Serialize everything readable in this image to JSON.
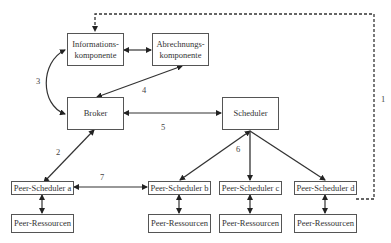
{
  "diagram": {
    "type": "architecture",
    "nodes": {
      "info": {
        "line1": "Informations-",
        "line2": "komponente"
      },
      "abrechnung": {
        "line1": "Abrechnungs-",
        "line2": "komponente"
      },
      "broker": {
        "label": "Broker"
      },
      "scheduler": {
        "label": "Scheduler"
      },
      "peer_scheduler_a": {
        "label": "Peer-Scheduler a"
      },
      "peer_scheduler_b": {
        "label": "Peer-Scheduler b"
      },
      "peer_scheduler_c": {
        "label": "Peer-Scheduler c"
      },
      "peer_scheduler_d": {
        "label": "Peer-Scheduler d"
      },
      "peer_ressourcen_a": {
        "label": "Peer-Ressourcen"
      },
      "peer_ressourcen_b": {
        "label": "Peer-Ressourcen"
      },
      "peer_ressourcen_c": {
        "label": "Peer-Ressourcen"
      },
      "peer_ressourcen_d": {
        "label": "Peer-Ressourcen"
      }
    },
    "edge_labels": {
      "e1": "1",
      "e2": "2",
      "e3": "3",
      "e4": "4",
      "e5": "5",
      "e6": "6",
      "e7": "7"
    },
    "edges": [
      {
        "id": "1",
        "from": "Peer-Scheduler d",
        "to": "Informationskomponente",
        "style": "dashed"
      },
      {
        "id": "2",
        "from": "Peer-Scheduler a",
        "to": "Broker",
        "style": "bidirectional"
      },
      {
        "id": "3",
        "from": "Informationskomponente",
        "to": "Broker",
        "style": "curved-bidirectional"
      },
      {
        "id": "4",
        "from": "Abrechnungskomponente",
        "to": "Broker",
        "style": "bidirectional"
      },
      {
        "id": "5",
        "from": "Broker",
        "to": "Scheduler",
        "style": "bidirectional"
      },
      {
        "id": "6",
        "from": "Scheduler",
        "to": "Peer-Scheduler b/c/d",
        "style": "arrows"
      },
      {
        "id": "7",
        "from": "Peer-Scheduler a",
        "to": "Peer-Scheduler b",
        "style": "bidirectional"
      }
    ],
    "colors": {
      "line": "#333333",
      "box_border": "#555555",
      "text": "#333333"
    }
  }
}
